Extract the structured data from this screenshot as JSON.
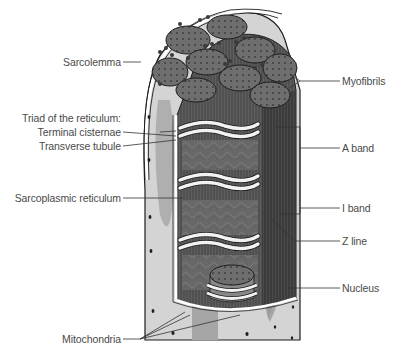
{
  "diagram": {
    "colors": {
      "background": "#ffffff",
      "fiber_cytoplasm": "#d6d6d6",
      "fiber_shadow": "#a8a8a8",
      "myofibril_cap": "#6b6b6b",
      "myofibril_body": "#5a5a5a",
      "reticulum": "#eeeeee",
      "membrane": "#ffffff",
      "outline": "#1e1e1e",
      "label_text": "#4a4a4a",
      "leader_line": "#333333",
      "nucleus": "#9a9a9a"
    },
    "labels": {
      "left": [
        {
          "id": "sarcolemma",
          "text": "Sarcolemma"
        },
        {
          "id": "triad",
          "text": "Triad of the reticulum:"
        },
        {
          "id": "terminal_cisternae",
          "text": "Terminal cisternae"
        },
        {
          "id": "transverse_tubule",
          "text": "Transverse tubule"
        },
        {
          "id": "sarcoplasmic_reticulum",
          "text": "Sarcoplasmic reticulum"
        },
        {
          "id": "mitochondria",
          "text": "Mitochondria"
        }
      ],
      "right": [
        {
          "id": "myofibrils",
          "text": "Myofibrils"
        },
        {
          "id": "a_band",
          "text": "A band"
        },
        {
          "id": "i_band",
          "text": "I band"
        },
        {
          "id": "z_line",
          "text": "Z line"
        },
        {
          "id": "nucleus",
          "text": "Nucleus"
        }
      ]
    }
  }
}
